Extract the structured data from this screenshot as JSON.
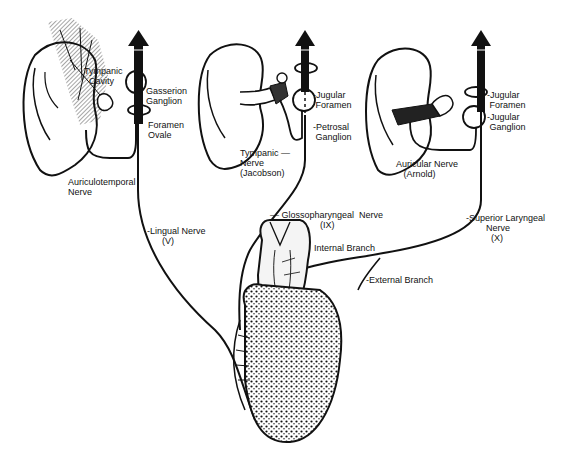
{
  "diagram": {
    "panels": [
      {
        "id": "trigeminal",
        "labels": {
          "tympanic_cavity": "Tympanic\n  Cavity",
          "gasserion_ganglion": "Gasserion\nGanglion",
          "foramen_ovale": "Foramen\nOvale",
          "auriculotemporal_nerve": "Auriculotemporal\nNerve"
        }
      },
      {
        "id": "glossopharyngeal",
        "labels": {
          "jugular_foramen": "-Jugular\n Foramen",
          "petrosal_ganglion": "-Petrosal\n Ganglion",
          "tympanic_nerve": "Tympanic —\nNerve\n(Jacobson)"
        }
      },
      {
        "id": "vagus",
        "labels": {
          "jugular_foramen": "-Jugular\n Foramen",
          "jugular_ganglion": "-Jugular\n Ganglion",
          "auricular_nerve": "Auricular Nerve\n   (Arnold)"
        }
      }
    ],
    "nerves": {
      "lingual": "-Lingual Nerve\n      (V)",
      "glossopharyngeal": "— Glossopharyngeal  Nerve\n                    (IX)",
      "superior_laryngeal": "-Superior Laryngeal\n        Nerve\n          (X)",
      "internal_branch": "Internal Branch",
      "external_branch": "-External Branch"
    }
  }
}
